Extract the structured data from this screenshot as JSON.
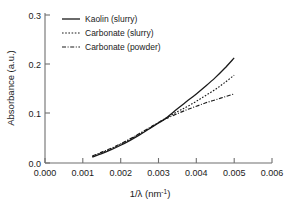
{
  "chart_data": {
    "type": "line",
    "title": "",
    "subtitle": "",
    "xlabel": "1/λ (nm⁻¹)",
    "xlabel_main": "1/λ (nm",
    "xlabel_sup": "-1",
    "xlabel_tail": ")",
    "ylabel": "Absorbance (a.u.)",
    "xlim": [
      0.0,
      0.006
    ],
    "ylim": [
      0.0,
      0.3
    ],
    "grid": false,
    "legend_position": "top-left-inside",
    "xticks": [
      0.0,
      0.001,
      0.002,
      0.003,
      0.004,
      0.005,
      0.006
    ],
    "xtick_labels": [
      "0.000",
      "0.001",
      "0.002",
      "0.003",
      "0.004",
      "0.005",
      "0.006"
    ],
    "yticks": [
      0.0,
      0.1,
      0.2,
      0.3
    ],
    "ytick_labels": [
      "0.0",
      "0.1",
      "0.2",
      "0.3"
    ],
    "series": [
      {
        "name": "Kaolin  (slurry)",
        "style": "solid",
        "color": "#1a1a1a",
        "x": [
          0.00125,
          0.0015,
          0.00175,
          0.002,
          0.00225,
          0.0025,
          0.00275,
          0.003,
          0.0032,
          0.0035,
          0.00375,
          0.004,
          0.00425,
          0.0045,
          0.00475,
          0.005
        ],
        "y": [
          0.012,
          0.019,
          0.027,
          0.036,
          0.046,
          0.057,
          0.069,
          0.081,
          0.091,
          0.11,
          0.125,
          0.14,
          0.156,
          0.173,
          0.192,
          0.213
        ]
      },
      {
        "name": "Carbonate (slurry)",
        "style": "dotted",
        "color": "#1a1a1a",
        "x": [
          0.00125,
          0.0015,
          0.00175,
          0.002,
          0.00225,
          0.0025,
          0.00275,
          0.003,
          0.0032,
          0.0035,
          0.00375,
          0.004,
          0.00425,
          0.0045,
          0.00475,
          0.005
        ],
        "y": [
          0.013,
          0.021,
          0.029,
          0.038,
          0.048,
          0.059,
          0.07,
          0.082,
          0.091,
          0.104,
          0.114,
          0.125,
          0.137,
          0.149,
          0.163,
          0.178
        ]
      },
      {
        "name": "Carbonate (powder)",
        "style": "dashdot",
        "color": "#1a1a1a",
        "x": [
          0.00125,
          0.0015,
          0.00175,
          0.002,
          0.00225,
          0.0025,
          0.00275,
          0.003,
          0.0032,
          0.0035,
          0.00375,
          0.004,
          0.00425,
          0.0045,
          0.00475,
          0.005
        ],
        "y": [
          0.014,
          0.022,
          0.03,
          0.039,
          0.049,
          0.06,
          0.071,
          0.082,
          0.09,
          0.1,
          0.108,
          0.115,
          0.122,
          0.128,
          0.134,
          0.14
        ]
      }
    ],
    "legend": [
      {
        "label": "Kaolin  (slurry)",
        "style": "solid"
      },
      {
        "label": "Carbonate (slurry)",
        "style": "dotted"
      },
      {
        "label": "Carbonate (powder)",
        "style": "dashdot"
      }
    ],
    "axis_color": "#6f6f6f",
    "text_color": "#1a1a1a"
  }
}
